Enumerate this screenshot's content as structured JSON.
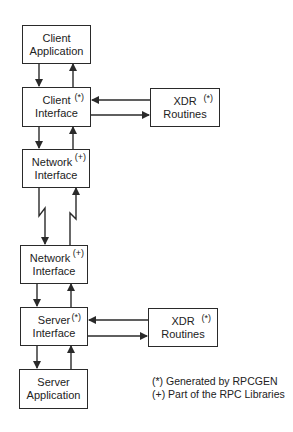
{
  "diagram": {
    "boxes": {
      "client_application": {
        "line1": "Client",
        "line2": "Application",
        "mark": ""
      },
      "client_interface": {
        "line1": "Client",
        "line2": "Interface",
        "mark": "(*)"
      },
      "xdr_client": {
        "line1": "XDR",
        "line2": "Routines",
        "mark": "(*)"
      },
      "network_interface_top": {
        "line1": "Network",
        "line2": "Interface",
        "mark": "(+)"
      },
      "network_interface_bottom": {
        "line1": "Network",
        "line2": "Interface",
        "mark": "(+)"
      },
      "server_interface": {
        "line1": "Server",
        "line2": "Interface",
        "mark": "(*)"
      },
      "xdr_server": {
        "line1": "XDR",
        "line2": "Routines",
        "mark": "(*)"
      },
      "server_application": {
        "line1": "Server",
        "line2": "Application",
        "mark": ""
      }
    },
    "legend": {
      "generated": "(*) Generated by RPCGEN",
      "library": "(+) Part of the RPC Libraries"
    },
    "colors": {
      "stroke": "#2a2a2a",
      "background": "#ffffff"
    }
  }
}
